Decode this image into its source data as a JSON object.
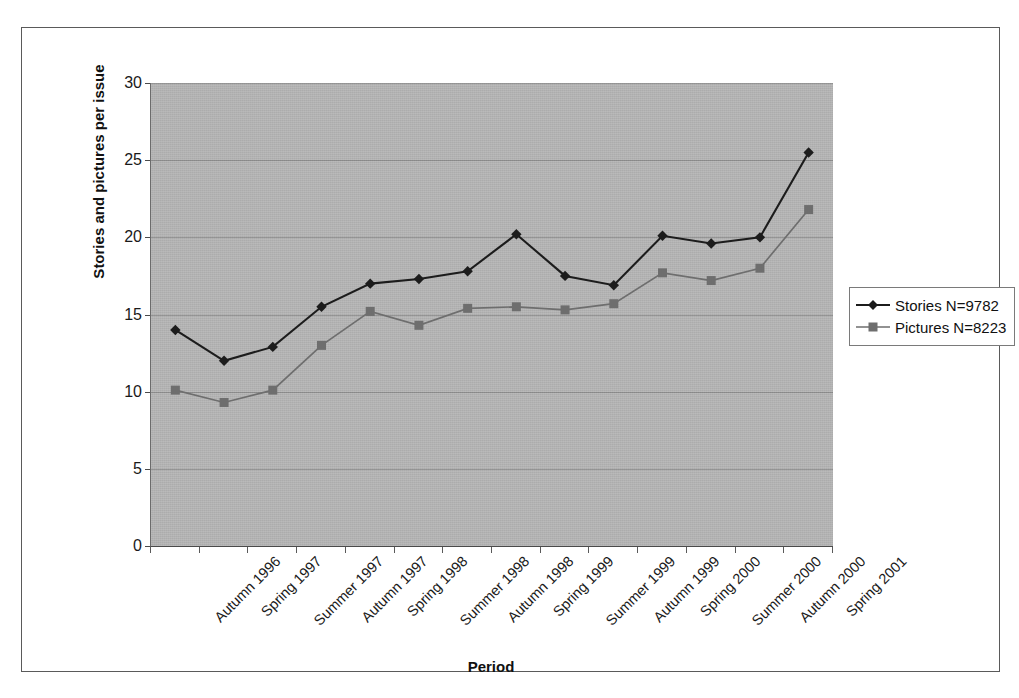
{
  "chart_data": {
    "type": "line",
    "title": "",
    "xlabel": "Period",
    "ylabel": "Stories and pictures per issue",
    "categories": [
      "Autumn 1996",
      "Spring 1997",
      "Summer 1997",
      "Autumn 1997",
      "Spring 1998",
      "Summer 1998",
      "Autumn 1998",
      "Spring 1999",
      "Summer 1999",
      "Autumn 1999",
      "Spring 2000",
      "Summer 2000",
      "Autumn 2000",
      "Spring 2001"
    ],
    "series": [
      {
        "name": "Stories N=9782",
        "marker": "diamond",
        "color": "#1c1c1c",
        "values": [
          14.0,
          12.0,
          12.9,
          15.5,
          17.0,
          17.3,
          17.8,
          20.2,
          17.5,
          16.9,
          20.1,
          19.6,
          20.0,
          25.5
        ]
      },
      {
        "name": "Pictures N=8223",
        "marker": "square",
        "color": "#6e6e6e",
        "values": [
          10.1,
          9.3,
          10.1,
          13.0,
          15.2,
          14.3,
          15.4,
          15.5,
          15.3,
          15.7,
          17.7,
          17.2,
          18.0,
          21.8
        ]
      }
    ],
    "ylim": [
      0,
      30
    ],
    "ytick_values": [
      0,
      5,
      10,
      15,
      20,
      25,
      30
    ],
    "ytick_labels": [
      "0",
      "5",
      "10",
      "15",
      "20",
      "25",
      "30"
    ],
    "grid": true,
    "legend_position": "right",
    "plot_background": "#b3b3b3",
    "gridline_color": "#8d8d8d"
  },
  "legend": {
    "entries": [
      {
        "label": "Stories N=9782"
      },
      {
        "label": "Pictures N=8223"
      }
    ]
  }
}
